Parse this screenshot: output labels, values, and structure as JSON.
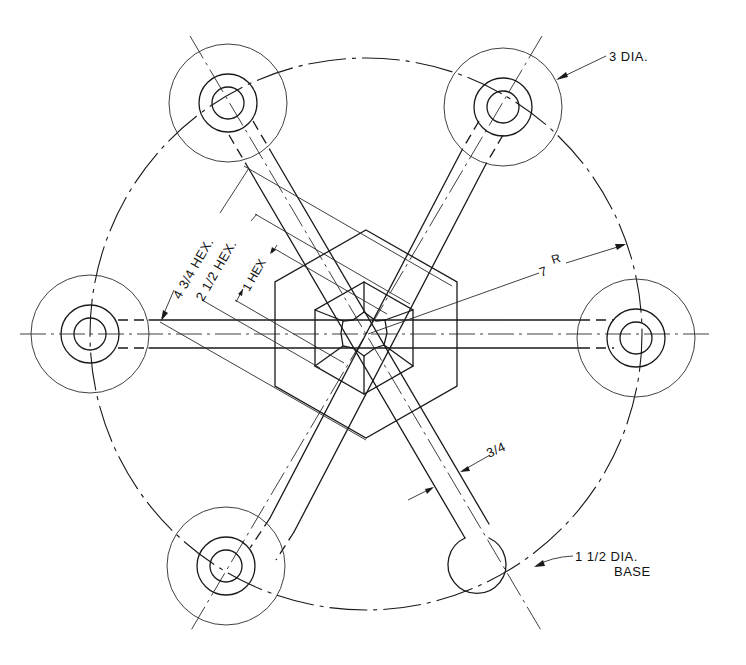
{
  "drawing": {
    "type": "engineering-plan-view",
    "subject": "six-arm spider with hex center boss",
    "labels": {
      "hub_diameter": "3 DIA.",
      "hex_large": "4 3/4 HEX.",
      "hex_medium": "2 1/2 HEX.",
      "hex_small": "1 HEX",
      "bolt_radius": "7",
      "bolt_radius_suffix": "R",
      "arm_width": "3/4",
      "base_diameter_line1": "1 1/2 DIA.",
      "base_diameter_line2": "BASE"
    },
    "hubs": [
      {
        "position": "right",
        "angle_deg": 0
      },
      {
        "position": "upper-right",
        "angle_deg": 60
      },
      {
        "position": "upper-left",
        "angle_deg": 120
      },
      {
        "position": "left",
        "angle_deg": 180
      },
      {
        "position": "lower-left",
        "angle_deg": 240
      }
    ],
    "base": {
      "position": "lower-right",
      "angle_deg": 300
    },
    "colors": {
      "ink": "#1a1a1a",
      "paper": "#ffffff"
    }
  }
}
